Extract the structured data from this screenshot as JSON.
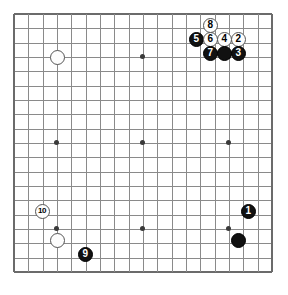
{
  "board": {
    "size": 19,
    "origin_x": 14,
    "origin_y": 14,
    "spacing": 14.33,
    "stone_diameter": 15,
    "line_color": "#8a8a8a",
    "edge_color": "#6b6b6b",
    "background_color": "#ffffff",
    "black_color": "#111111",
    "white_color": "#fdfdfd",
    "hoshi_points": [
      {
        "col": 4,
        "row": 4
      },
      {
        "col": 10,
        "row": 4
      },
      {
        "col": 16,
        "row": 4
      },
      {
        "col": 4,
        "row": 10
      },
      {
        "col": 10,
        "row": 10
      },
      {
        "col": 16,
        "row": 10
      },
      {
        "col": 4,
        "row": 16
      },
      {
        "col": 10,
        "row": 16
      },
      {
        "col": 16,
        "row": 16
      }
    ]
  },
  "stones": [
    {
      "name": "stone-white-d16",
      "color": "white",
      "label": "",
      "x": 57,
      "y": 57
    },
    {
      "name": "stone-white-move-8",
      "color": "white",
      "label": "8",
      "x": 210,
      "y": 25
    },
    {
      "name": "stone-black-move-5",
      "color": "black",
      "label": "5",
      "x": 196,
      "y": 39
    },
    {
      "name": "stone-white-move-6",
      "color": "white",
      "label": "6",
      "x": 210,
      "y": 39
    },
    {
      "name": "stone-white-move-4",
      "color": "white",
      "label": "4",
      "x": 224,
      "y": 39
    },
    {
      "name": "stone-white-move-2",
      "color": "white",
      "label": "2",
      "x": 238,
      "y": 39
    },
    {
      "name": "stone-black-move-7",
      "color": "black",
      "label": "7",
      "x": 210,
      "y": 53
    },
    {
      "name": "stone-black-unnumbered-top",
      "color": "black",
      "label": "",
      "x": 224,
      "y": 53
    },
    {
      "name": "stone-black-move-3",
      "color": "black",
      "label": "3",
      "x": 238,
      "y": 53
    },
    {
      "name": "stone-white-move-10",
      "color": "white",
      "label": "10",
      "x": 42,
      "y": 211
    },
    {
      "name": "stone-black-move-1",
      "color": "black",
      "label": "1",
      "x": 248,
      "y": 211
    },
    {
      "name": "stone-white-lower-left",
      "color": "white",
      "label": "",
      "x": 57,
      "y": 240
    },
    {
      "name": "stone-black-lower-right",
      "color": "black",
      "label": "",
      "x": 238,
      "y": 240
    },
    {
      "name": "stone-black-move-9",
      "color": "black",
      "label": "9",
      "x": 85,
      "y": 254
    }
  ]
}
